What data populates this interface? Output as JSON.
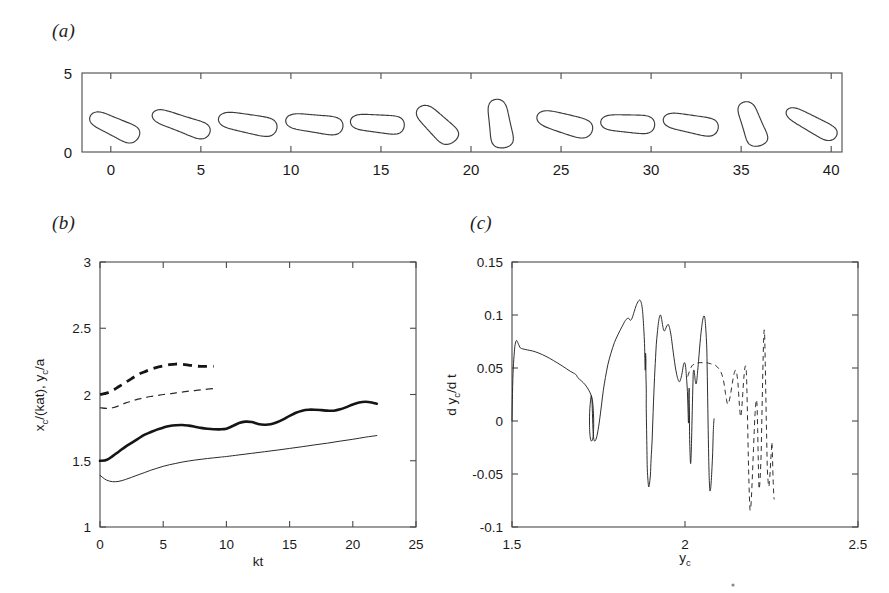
{
  "figure": {
    "panels": [
      {
        "id": "a",
        "label": "(a)"
      },
      {
        "id": "b",
        "label": "(b)"
      },
      {
        "id": "c",
        "label": "(c)"
      }
    ]
  },
  "chart_data": [
    {
      "type": "scatter",
      "panel": "a",
      "title": "(a)",
      "xlabel": "",
      "ylabel": "",
      "xlim": [
        -1.6,
        40.6
      ],
      "ylim": [
        0,
        5
      ],
      "xticks": [
        0,
        5,
        10,
        15,
        20,
        25,
        30,
        35,
        40
      ],
      "xticklabels": [
        "0",
        "5",
        "10",
        "15",
        "20",
        "25",
        "30",
        "35",
        "40"
      ],
      "yticks": [
        0,
        5
      ],
      "yticklabels": [
        "0",
        "5"
      ],
      "grid": false,
      "legend": "none",
      "description": "Sequence of twelve deformable drop (dumbbell-shaped) interface contours shown at successive streamwise stations, centred near y = 1.7",
      "shapes": [
        {
          "index": 1,
          "x_center": 0.2,
          "y_center": 1.6,
          "rotation_deg": -28,
          "length": 3.0,
          "waist": 0.55,
          "lobe": 0.95
        },
        {
          "index": 2,
          "x_center": 3.9,
          "y_center": 1.8,
          "rotation_deg": -22,
          "length": 3.4,
          "waist": 0.5,
          "lobe": 0.9
        },
        {
          "index": 3,
          "x_center": 7.6,
          "y_center": 1.8,
          "rotation_deg": -12,
          "length": 3.3,
          "waist": 0.58,
          "lobe": 0.95
        },
        {
          "index": 4,
          "x_center": 11.3,
          "y_center": 1.8,
          "rotation_deg": -8,
          "length": 3.2,
          "waist": 0.55,
          "lobe": 0.92
        },
        {
          "index": 5,
          "x_center": 14.8,
          "y_center": 1.8,
          "rotation_deg": -6,
          "length": 3.0,
          "waist": 0.55,
          "lobe": 0.92
        },
        {
          "index": 6,
          "x_center": 18.1,
          "y_center": 1.75,
          "rotation_deg": -48,
          "length": 2.9,
          "waist": 0.6,
          "lobe": 1.0
        },
        {
          "index": 7,
          "x_center": 21.6,
          "y_center": 1.8,
          "rotation_deg": -82,
          "length": 3.1,
          "waist": 0.58,
          "lobe": 1.0
        },
        {
          "index": 8,
          "x_center": 25.2,
          "y_center": 1.8,
          "rotation_deg": -18,
          "length": 3.2,
          "waist": 0.6,
          "lobe": 0.95
        },
        {
          "index": 9,
          "x_center": 28.7,
          "y_center": 1.8,
          "rotation_deg": -4,
          "length": 3.0,
          "waist": 0.55,
          "lobe": 0.9
        },
        {
          "index": 10,
          "x_center": 32.2,
          "y_center": 1.78,
          "rotation_deg": -12,
          "length": 3.1,
          "waist": 0.55,
          "lobe": 0.92
        },
        {
          "index": 11,
          "x_center": 35.6,
          "y_center": 1.78,
          "rotation_deg": -72,
          "length": 2.9,
          "waist": 0.55,
          "lobe": 0.98
        },
        {
          "index": 12,
          "x_center": 38.9,
          "y_center": 1.8,
          "rotation_deg": -32,
          "length": 3.2,
          "waist": 0.48,
          "lobe": 0.8
        }
      ]
    },
    {
      "type": "line",
      "panel": "b",
      "title": "(b)",
      "xlabel": "kt",
      "ylabel": "x_c/(kat), y_c/a",
      "ylabel_parts": [
        "x",
        "c",
        "/(kat), ",
        "y",
        "c",
        "/a"
      ],
      "xlim": [
        0,
        25
      ],
      "ylim": [
        1,
        3
      ],
      "xticks": [
        0,
        5,
        10,
        15,
        20,
        25
      ],
      "xticklabels": [
        "0",
        "5",
        "10",
        "15",
        "20",
        "25"
      ],
      "yticks": [
        1,
        1.5,
        2,
        2.5,
        3
      ],
      "yticklabels": [
        "1",
        "1.5",
        "2",
        "2.5",
        "3"
      ],
      "grid": false,
      "legend": "none",
      "series": [
        {
          "name": "dashed-thick",
          "style": "dashed-thick",
          "x": [
            0,
            0.5,
            1,
            1.5,
            2,
            2.5,
            3,
            3.5,
            4,
            4.5,
            5,
            5.5,
            6,
            6.5,
            7,
            7.5,
            8,
            8.5,
            9
          ],
          "y": [
            2.0,
            2.01,
            2.03,
            2.06,
            2.09,
            2.12,
            2.15,
            2.17,
            2.19,
            2.205,
            2.215,
            2.225,
            2.23,
            2.228,
            2.222,
            2.215,
            2.212,
            2.212,
            2.212
          ]
        },
        {
          "name": "dashed-thin",
          "style": "dashed-thin",
          "x": [
            0,
            0.5,
            1,
            1.5,
            2,
            2.5,
            3,
            3.5,
            4,
            4.5,
            5,
            5.5,
            6,
            6.5,
            7,
            7.5,
            8,
            8.5,
            9
          ],
          "y": [
            1.9,
            1.895,
            1.9,
            1.915,
            1.935,
            1.95,
            1.965,
            1.975,
            1.985,
            1.992,
            2.0,
            2.005,
            2.012,
            2.018,
            2.025,
            2.03,
            2.035,
            2.04,
            2.045
          ]
        },
        {
          "name": "solid-thick",
          "style": "solid-thick",
          "x": [
            0,
            0.5,
            1,
            1.5,
            2,
            2.5,
            3,
            3.5,
            4,
            4.5,
            5,
            5.5,
            6,
            6.5,
            7,
            7.5,
            8,
            8.5,
            9,
            9.5,
            10,
            10.5,
            11,
            11.5,
            12,
            12.5,
            13,
            13.5,
            14,
            14.5,
            15,
            15.5,
            16,
            16.5,
            17,
            17.5,
            18,
            18.5,
            19,
            19.5,
            20,
            20.5,
            21,
            21.5,
            21.9
          ],
          "y": [
            1.5,
            1.505,
            1.535,
            1.57,
            1.605,
            1.635,
            1.665,
            1.695,
            1.715,
            1.735,
            1.75,
            1.762,
            1.768,
            1.77,
            1.765,
            1.757,
            1.748,
            1.742,
            1.738,
            1.737,
            1.742,
            1.762,
            1.785,
            1.795,
            1.792,
            1.778,
            1.772,
            1.775,
            1.79,
            1.812,
            1.838,
            1.862,
            1.878,
            1.885,
            1.885,
            1.882,
            1.878,
            1.878,
            1.888,
            1.905,
            1.925,
            1.94,
            1.945,
            1.94,
            1.93
          ]
        },
        {
          "name": "solid-thin",
          "style": "solid-thin",
          "x": [
            0,
            0.5,
            1,
            1.5,
            2,
            2.5,
            3,
            3.5,
            4,
            4.5,
            5,
            5.5,
            6,
            6.5,
            7,
            7.5,
            8,
            8.5,
            9,
            9.5,
            10,
            11,
            12,
            13,
            14,
            15,
            16,
            17,
            18,
            19,
            20,
            21,
            21.9
          ],
          "y": [
            1.39,
            1.355,
            1.342,
            1.345,
            1.358,
            1.375,
            1.393,
            1.41,
            1.428,
            1.443,
            1.458,
            1.47,
            1.48,
            1.49,
            1.498,
            1.505,
            1.511,
            1.517,
            1.522,
            1.527,
            1.532,
            1.544,
            1.556,
            1.568,
            1.58,
            1.593,
            1.606,
            1.62,
            1.633,
            1.648,
            1.662,
            1.678,
            1.69
          ]
        }
      ]
    },
    {
      "type": "line",
      "panel": "c",
      "title": "(c)",
      "xlabel": "y_c",
      "ylabel": "d y_c/d t",
      "xlim": [
        1.5,
        2.5
      ],
      "ylim": [
        -0.1,
        0.15
      ],
      "xticks": [
        1.5,
        2,
        2.5
      ],
      "xticklabels": [
        "1.5",
        "2",
        "2.5"
      ],
      "yticks": [
        -0.1,
        -0.05,
        0,
        0.05,
        0.1,
        0.15
      ],
      "yticklabels": [
        "-0.1",
        "-0.05",
        "0",
        "0.05",
        "0.1",
        "0.15"
      ],
      "grid": false,
      "legend": "none",
      "description": "Phase-plane trajectory of drop centroid vertical velocity vs vertical position; solid curve is one case, dashed curve a second case clustered near y_c = 2.2"
    }
  ]
}
